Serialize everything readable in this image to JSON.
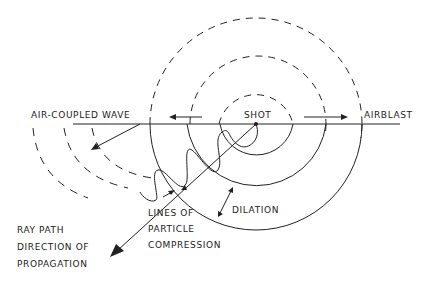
{
  "diagram": {
    "title": "",
    "labels": {
      "air_coupled_wave": "AIR-COUPLED WAVE",
      "shot": "SHOT",
      "airblast": "AIRBLAST",
      "dilation": "DILATION",
      "lines_of_particle_compression": [
        "LINES OF",
        "PARTICLE",
        "COMPRESSION"
      ],
      "ray_path": [
        "RAY PATH",
        "DIRECTION OF",
        "PROPAGATION"
      ]
    },
    "elements": {
      "ground_surface": "horizontal line",
      "shot_point": "source at ground surface",
      "airblast_wavefronts": "dashed semicircles above ground (3)",
      "ground_wavefronts": "solid semicircles below ground (3)",
      "air_coupled_wavefronts": "dashed arcs below ground on left (3)",
      "ray_path_arrow": "arrow from shot down-left",
      "particle_motion": "sinusoidal wave along ray path",
      "airblast_direction_arrows": [
        "left arrow",
        "right arrow"
      ]
    },
    "colors": {
      "line": "#222222",
      "background": "#ffffff"
    }
  }
}
